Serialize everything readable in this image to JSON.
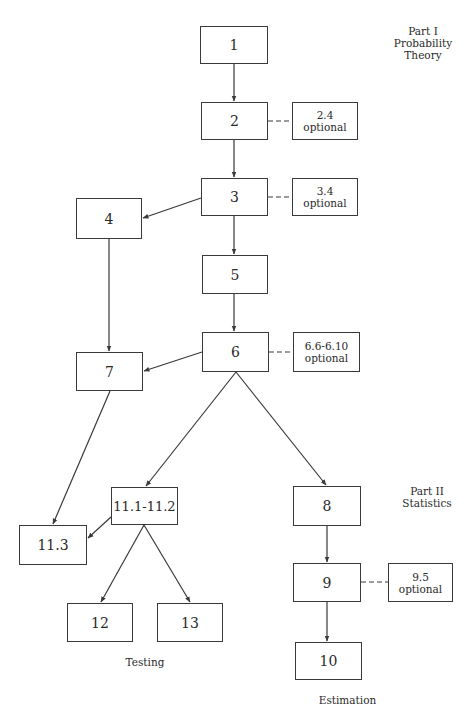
{
  "part_labels": {
    "part1": [
      "Part I",
      "Probability",
      "Theory"
    ],
    "part2": [
      "Part II",
      "Statistics"
    ]
  },
  "group_labels": {
    "testing": "Testing",
    "estimation": "Estimation"
  },
  "nodes": {
    "n1": {
      "label": "1"
    },
    "n2": {
      "label": "2"
    },
    "n3": {
      "label": "3"
    },
    "n4": {
      "label": "4"
    },
    "n5": {
      "label": "5"
    },
    "n6": {
      "label": "6"
    },
    "n7": {
      "label": "7"
    },
    "n8": {
      "label": "8"
    },
    "n9": {
      "label": "9"
    },
    "n10": {
      "label": "10"
    },
    "n11a": {
      "label": "11.1-11.2"
    },
    "n11b": {
      "label": "11.3"
    },
    "n12": {
      "label": "12"
    },
    "n13": {
      "label": "13"
    }
  },
  "optional_nodes": {
    "o2": {
      "section": "2.4",
      "note": "optional"
    },
    "o3": {
      "section": "3.4",
      "note": "optional"
    },
    "o6": {
      "section": "6.6-6.10",
      "note": "optional"
    },
    "o9": {
      "section": "9.5",
      "note": "optional"
    }
  },
  "edges": [
    {
      "from": "1",
      "to": "2",
      "type": "arrow"
    },
    {
      "from": "2",
      "to": "3",
      "type": "arrow"
    },
    {
      "from": "3",
      "to": "4",
      "type": "arrow"
    },
    {
      "from": "3",
      "to": "5",
      "type": "arrow"
    },
    {
      "from": "5",
      "to": "6",
      "type": "arrow"
    },
    {
      "from": "4",
      "to": "7",
      "type": "arrow"
    },
    {
      "from": "6",
      "to": "7",
      "type": "arrow"
    },
    {
      "from": "6",
      "to": "11.1-11.2",
      "type": "arrow"
    },
    {
      "from": "6",
      "to": "8",
      "type": "arrow"
    },
    {
      "from": "7",
      "to": "11.3",
      "type": "arrow"
    },
    {
      "from": "11.1-11.2",
      "to": "11.3",
      "type": "arrow"
    },
    {
      "from": "11.1-11.2",
      "to": "12",
      "type": "arrow"
    },
    {
      "from": "11.1-11.2",
      "to": "13",
      "type": "arrow"
    },
    {
      "from": "8",
      "to": "9",
      "type": "arrow"
    },
    {
      "from": "9",
      "to": "10",
      "type": "arrow"
    },
    {
      "from": "2",
      "to": "2.4 optional",
      "type": "dashed"
    },
    {
      "from": "3",
      "to": "3.4 optional",
      "type": "dashed"
    },
    {
      "from": "6",
      "to": "6.6-6.10 optional",
      "type": "dashed"
    },
    {
      "from": "9",
      "to": "9.5 optional",
      "type": "dashed"
    }
  ],
  "colors": {
    "line": "#3a3a3a",
    "text": "#2a2a2a",
    "background": "#ffffff"
  }
}
